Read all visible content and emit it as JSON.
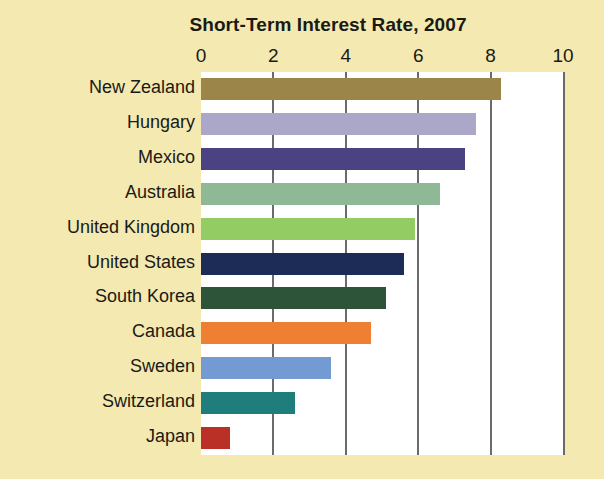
{
  "chart_data": {
    "type": "bar",
    "orientation": "horizontal",
    "title": "Short-Term Interest Rate, 2007",
    "xlabel": "",
    "ylabel": "",
    "xlim": [
      0,
      10
    ],
    "xticks": [
      "0",
      "2",
      "4",
      "6",
      "8",
      "10"
    ],
    "xtick_values": [
      0,
      2,
      4,
      6,
      8,
      10
    ],
    "grid": "vertical",
    "legend": "none",
    "categories": [
      "New Zealand",
      "Hungary",
      "Mexico",
      "Australia",
      "United Kingdom",
      "United States",
      "South Korea",
      "Canada",
      "Sweden",
      "Switzerland",
      "Japan"
    ],
    "values": [
      8.3,
      7.6,
      7.3,
      6.6,
      5.9,
      5.6,
      5.1,
      4.7,
      3.6,
      2.6,
      0.8
    ],
    "bar_colors": [
      "#9b8548",
      "#aaa7c8",
      "#4b4284",
      "#8fb996",
      "#92cc63",
      "#1d2b57",
      "#2d5338",
      "#ee7f33",
      "#739ad2",
      "#1f7d7c",
      "#bb3026"
    ]
  },
  "style": {
    "background": "#f4e9b0",
    "plot_background": "#ffffff",
    "gridline_color": "#6b6b6b",
    "text_color": "#1a1a16"
  }
}
